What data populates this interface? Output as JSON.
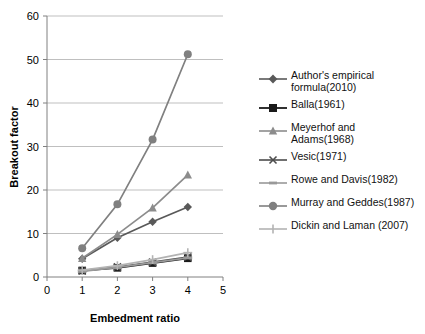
{
  "chart_data": {
    "type": "line",
    "title": "",
    "xlabel": "Embedment ratio",
    "ylabel": "Breakout factor",
    "xlim": [
      0,
      5
    ],
    "ylim": [
      0,
      60
    ],
    "xticks": [
      "0",
      "1",
      "2",
      "3",
      "4",
      "5"
    ],
    "yticks": [
      "0",
      "10",
      "20",
      "30",
      "40",
      "50",
      "60"
    ],
    "grid": "horizontal",
    "legend_position": "right",
    "x": [
      1,
      2,
      3,
      4
    ],
    "series": [
      {
        "name": "Author's empirical formula(2010)",
        "label": "Author's empirical\nformula(2010)",
        "marker": "diamond",
        "color": "#595959",
        "values": [
          4.2,
          9.0,
          12.7,
          16.1
        ]
      },
      {
        "name": "Balla(1961)",
        "label": "Balla(1961)",
        "marker": "square",
        "color": "#1a1a1a",
        "values": [
          1.5,
          2.1,
          3.2,
          4.3
        ]
      },
      {
        "name": "Meyerhof and Adams(1968)",
        "label": "Meyerhof and\nAdams(1968)",
        "marker": "triangle",
        "color": "#8c8c8c",
        "values": [
          4.3,
          9.8,
          15.9,
          23.5
        ]
      },
      {
        "name": "Vesic(1971)",
        "label": "Vesic(1971)",
        "marker": "cross",
        "color": "#4d4d4d",
        "values": [
          1.4,
          2.3,
          3.4,
          4.6
        ]
      },
      {
        "name": "Rowe and Davis(1982)",
        "label": "Rowe and Davis(1982)",
        "marker": "dash",
        "color": "#999999",
        "values": [
          1.3,
          2.2,
          3.3,
          4.4
        ]
      },
      {
        "name": "Murray and Geddes(1987)",
        "label": "Murray and Geddes(1987)",
        "marker": "circle",
        "color": "#808080",
        "values": [
          6.6,
          16.7,
          31.6,
          51.2
        ]
      },
      {
        "name": "Dickin and Laman (2007)",
        "label": "Dickin and Laman (2007)",
        "marker": "plus",
        "color": "#b3b3b3",
        "values": [
          1.6,
          2.6,
          4.0,
          5.6
        ]
      }
    ]
  },
  "axes": {
    "ylabel": "Breakout factor",
    "xlabel": "Embedment ratio",
    "yticks": [
      "60",
      "50",
      "40",
      "30",
      "20",
      "10",
      "0"
    ],
    "xticks": [
      "0",
      "1",
      "2",
      "3",
      "4",
      "5"
    ]
  },
  "legend": {
    "items": [
      {
        "label": "Author's empirical\nformula(2010)"
      },
      {
        "label": "Balla(1961)"
      },
      {
        "label": "Meyerhof and\nAdams(1968)"
      },
      {
        "label": "Vesic(1971)"
      },
      {
        "label": "Rowe and Davis(1982)"
      },
      {
        "label": "Murray and Geddes(1987)"
      },
      {
        "label": "Dickin and Laman (2007)"
      }
    ]
  }
}
